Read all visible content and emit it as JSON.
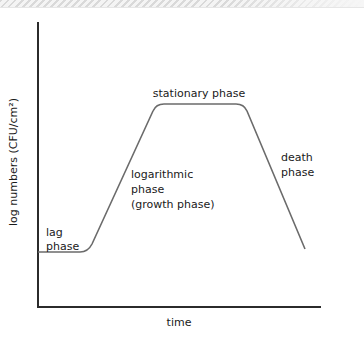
{
  "diagram": {
    "y_axis_label": "log numbers (CFU/cm²)",
    "x_axis_label": "time",
    "phases": [
      {
        "name": "lag",
        "label_lines": [
          "lag",
          "phase"
        ]
      },
      {
        "name": "logarithmic",
        "label_lines": [
          "logarithmic",
          "phase",
          "(growth phase)"
        ]
      },
      {
        "name": "stationary",
        "label_lines": [
          "stationary phase"
        ]
      },
      {
        "name": "death",
        "label_lines": [
          "death",
          "phase"
        ]
      }
    ],
    "colors": {
      "axis": "#2b2b2b",
      "curve": "#6b6b6b",
      "text": "#1a1a1a"
    }
  }
}
